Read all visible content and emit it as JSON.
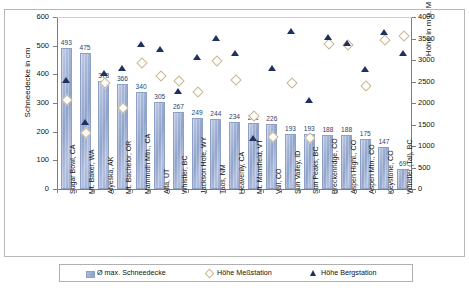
{
  "axes": {
    "left_title": "Schneedecke in cm",
    "right_title": "Höhe in m ü. M",
    "left_ticks": [
      "0",
      "100",
      "200",
      "300",
      "400",
      "500",
      "600"
    ],
    "right_ticks": [
      "0",
      "500",
      "1000",
      "1500",
      "2000",
      "2500",
      "3000",
      "3500",
      "4000"
    ]
  },
  "legend": {
    "bar_label": "Ø max. Schneedecke",
    "diamond_label": "Höhe Meßstation",
    "triangle_label": "Höhe Bergstation"
  },
  "chart_data": {
    "type": "bar",
    "title": "",
    "xlabel": "",
    "ylabel": "Schneedecke in cm",
    "y2label": "Höhe in m ü. M",
    "ylim": [
      0,
      600
    ],
    "y2lim": [
      0,
      4000
    ],
    "grid": false,
    "legend_position": "bottom",
    "categories": [
      "Sugar Bowl, CA",
      "Mt. Baker, WA",
      "Alyeska, AK",
      "Mt. Bachelor, OR",
      "Mammoth Mtn., CA",
      "Alta, UT",
      "Whistler, BC",
      "Jackson Hole, WY",
      "Taos, NM",
      "Heavenly, CA",
      "Mt. Mansfield, VT",
      "Vail, CO",
      "Sun Valley, ID",
      "Sun Peaks, BC",
      "Breckenridge, CO",
      "Aspen Highl., CO",
      "Aspen Mtn., CO",
      "Keystone, CO",
      "Whistler (Tal), BC"
    ],
    "series": [
      {
        "name": "Ø max. Schneedecke",
        "unit": "cm",
        "axis": "left",
        "marker": "bar",
        "values": [
          493,
          475,
          378,
          366,
          340,
          305,
          267,
          249,
          244,
          234,
          231,
          226,
          193,
          193,
          188,
          188,
          175,
          147,
          69
        ]
      },
      {
        "name": "Höhe Meßstation",
        "unit": "m",
        "axis": "right",
        "marker": "diamond",
        "values": [
          2100,
          1320,
          2500,
          1910,
          2960,
          2640,
          2530,
          2270,
          3000,
          2550,
          1720,
          1230,
          2500,
          1220,
          3400,
          3380,
          2420,
          3500,
          3570
        ]
      },
      {
        "name": "Höhe Bergstation",
        "unit": "m",
        "axis": "right",
        "marker": "triangle",
        "values": [
          2520,
          1540,
          2680,
          2800,
          3370,
          3240,
          2270,
          3060,
          3500,
          3160,
          1170,
          2800,
          3670,
          2060,
          3520,
          3380,
          2770,
          3650,
          3150
        ]
      }
    ]
  }
}
